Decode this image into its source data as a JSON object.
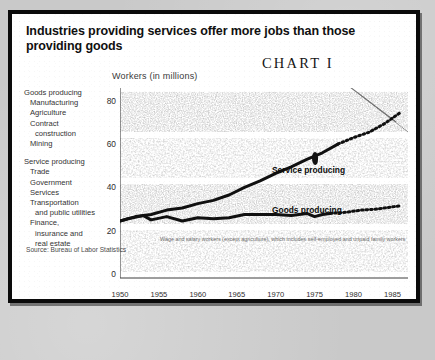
{
  "title": "Industries providing services offer more jobs than those providing goods",
  "chart_number": "CHART I",
  "axis_title": "Workers (in millions)",
  "source": "Source: Bureau of Labor Statistics",
  "footnote": "Wage and salary workers (except agriculture), which includes self-employed and unpaid family workers",
  "legend": {
    "groups": [
      {
        "head": "Goods producing",
        "items": [
          "Manufacturing",
          "Agriculture",
          "Contract",
          "construction",
          "Mining"
        ]
      },
      {
        "head": "Service producing",
        "items": [
          "Trade",
          "Government",
          "Services",
          "Transportation",
          "and public utilities",
          "Finance,",
          "insurance and",
          "real estate"
        ]
      }
    ]
  },
  "chart_data": {
    "type": "line",
    "title": "Industries providing services offer more jobs than those providing goods",
    "subtitle": "CHART I",
    "xlabel": "",
    "ylabel": "Workers (in millions)",
    "xlim": [
      1950,
      1987
    ],
    "ylim": [
      0,
      85
    ],
    "yticks": [
      0,
      20,
      40,
      60,
      80
    ],
    "xticks": [
      1950,
      1955,
      1960,
      1965,
      1970,
      1975,
      1980,
      1985
    ],
    "grid": true,
    "legend_position": "in-plot",
    "series": [
      {
        "name": "Service producing",
        "color": "#101010",
        "style": "solid-then-dotted",
        "dash_from": 1978,
        "x": [
          1950,
          1952,
          1954,
          1956,
          1958,
          1960,
          1962,
          1964,
          1966,
          1968,
          1970,
          1972,
          1974,
          1976,
          1978,
          1980,
          1982,
          1984,
          1985,
          1986
        ],
        "values": [
          24.5,
          26.5,
          27.5,
          29.5,
          30.5,
          32.5,
          34.0,
          36.5,
          40.0,
          43.0,
          46.5,
          49.5,
          53.0,
          56.0,
          60.0,
          63.0,
          65.5,
          69.5,
          72.0,
          74.5
        ]
      },
      {
        "name": "Goods producing",
        "color": "#101010",
        "style": "solid-then-dotted",
        "dash_from": 1977,
        "x": [
          1950,
          1951,
          1953,
          1954,
          1956,
          1958,
          1960,
          1962,
          1964,
          1966,
          1968,
          1970,
          1972,
          1974,
          1975,
          1976,
          1977,
          1979,
          1981,
          1983,
          1985,
          1986
        ],
        "values": [
          24.5,
          25.5,
          27.0,
          25.0,
          26.5,
          24.5,
          26.0,
          25.5,
          26.0,
          27.5,
          27.5,
          27.5,
          27.0,
          28.0,
          26.5,
          27.5,
          28.0,
          28.5,
          29.5,
          30.0,
          31.0,
          31.5
        ]
      }
    ],
    "annotations": [
      {
        "text": "Service producing",
        "x": 1976,
        "y": 57
      },
      {
        "text": "Goods producing",
        "x": 1976,
        "y": 40
      }
    ]
  }
}
